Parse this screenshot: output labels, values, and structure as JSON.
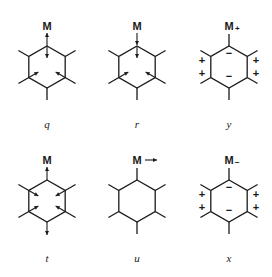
{
  "diagram": {
    "title": "",
    "panels": [
      {
        "id": "q",
        "caption": "q",
        "center": [
          47,
          67
        ],
        "metal_label": "M",
        "metal_charge": "",
        "metal_arrow": "up",
        "ring_arrows": [
          "top-down",
          "lower-left-in",
          "lower-right-in"
        ],
        "charges": []
      },
      {
        "id": "r",
        "caption": "r",
        "center": [
          137,
          67
        ],
        "metal_label": "M",
        "metal_charge": "",
        "metal_arrow": "down",
        "ring_arrows": [
          "top-down",
          "lower-left-in",
          "lower-right-in"
        ],
        "charges": []
      },
      {
        "id": "y",
        "caption": "y",
        "center": [
          229,
          67
        ],
        "metal_label": "M",
        "metal_charge": "+",
        "metal_arrow": "none",
        "ring_arrows": [],
        "charges": [
          {
            "pos": "top-inner",
            "sign": "−"
          },
          {
            "pos": "bottom-inner",
            "sign": "−"
          },
          {
            "pos": "left-upper",
            "sign": "+"
          },
          {
            "pos": "left-lower",
            "sign": "+"
          },
          {
            "pos": "right-upper",
            "sign": "+"
          },
          {
            "pos": "right-lower",
            "sign": "+"
          }
        ]
      },
      {
        "id": "t",
        "caption": "t",
        "center": [
          47,
          201
        ],
        "metal_label": "M",
        "metal_charge": "",
        "metal_arrow": "up",
        "ring_arrows": [
          "upper-left-in",
          "upper-right-in",
          "lower-left-in",
          "lower-right-in",
          "bottom-down"
        ],
        "charges": []
      },
      {
        "id": "u",
        "caption": "u",
        "center": [
          137,
          201
        ],
        "metal_label": "M",
        "metal_charge": "",
        "metal_arrow": "right",
        "ring_arrows": [],
        "charges": []
      },
      {
        "id": "x",
        "caption": "x",
        "center": [
          229,
          201
        ],
        "metal_label": "M",
        "metal_charge": "−",
        "metal_arrow": "none",
        "ring_arrows": [],
        "charges": [
          {
            "pos": "top-inner",
            "sign": "−"
          },
          {
            "pos": "bottom-inner",
            "sign": "−"
          },
          {
            "pos": "left-upper",
            "sign": "+"
          },
          {
            "pos": "left-lower",
            "sign": "+"
          },
          {
            "pos": "right-upper",
            "sign": "+"
          },
          {
            "pos": "right-lower",
            "sign": "+"
          }
        ]
      }
    ],
    "colors": {
      "ink": "#1a1a1a",
      "background": "#ffffff"
    }
  }
}
